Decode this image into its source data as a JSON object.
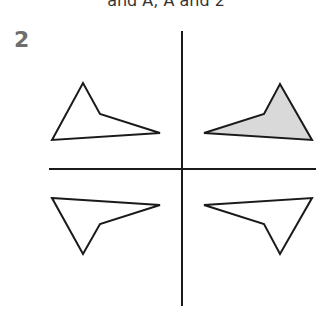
{
  "header": {
    "caption": "and A, A and 2"
  },
  "question": {
    "number": "2"
  },
  "figure": {
    "axes": {
      "horizontal": {
        "x1": 49,
        "y1": 169,
        "x2": 316,
        "y2": 169
      },
      "vertical": {
        "x1": 182,
        "y1": 31,
        "x2": 182,
        "y2": 306
      }
    },
    "shapes": [
      {
        "id": "top-left",
        "points": "52,140 83,83 100,114 160,133",
        "fill": "#ffffff"
      },
      {
        "id": "top-right",
        "points": "204,133 264,114 280,84 312,140",
        "fill": "#d9d9d9"
      },
      {
        "id": "bottom-left",
        "points": "52,198 160,205 100,224 83,254",
        "fill": "#ffffff"
      },
      {
        "id": "bottom-right",
        "points": "204,205 312,198 280,254 264,224",
        "fill": "#ffffff"
      }
    ],
    "colors": {
      "stroke": "#1a1a1a",
      "shaded": "#d9d9d9"
    }
  }
}
